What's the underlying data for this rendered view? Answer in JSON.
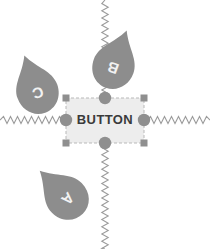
{
  "canvas": {
    "width": 210,
    "height": 249,
    "background": "#ffffff"
  },
  "button": {
    "label": "BUTTON",
    "fill": "#ededed",
    "text_color": "#3a3a3a",
    "selection_outline_color": "#b9b9b9",
    "box": {
      "x": 66,
      "y": 98,
      "width": 78,
      "height": 45
    }
  },
  "selection_handles": {
    "square_color": "#8f8f8f",
    "circle_color": "#8f8f8f",
    "corners": [
      {
        "name": "top-left",
        "x": 66,
        "y": 98
      },
      {
        "name": "top-right",
        "x": 144,
        "y": 98
      },
      {
        "name": "bottom-left",
        "x": 66,
        "y": 143
      },
      {
        "name": "bottom-right",
        "x": 144,
        "y": 143
      }
    ],
    "edges": [
      {
        "name": "top-center",
        "x": 105,
        "y": 98
      },
      {
        "name": "right-middle",
        "x": 144,
        "y": 120
      },
      {
        "name": "bottom-center",
        "x": 105,
        "y": 143
      },
      {
        "name": "left-middle",
        "x": 66,
        "y": 120
      }
    ]
  },
  "pins": [
    {
      "id": "pin-a",
      "label": "A",
      "cx": 68,
      "cy": 199,
      "rotation": 135,
      "fill": "#8d8d8d"
    },
    {
      "id": "pin-b",
      "label": "B",
      "cx": 113,
      "cy": 68,
      "rotation": 200,
      "fill": "#8d8d8d"
    },
    {
      "id": "pin-c",
      "label": "C",
      "cx": 38,
      "cy": 93,
      "rotation": 160,
      "fill": "#8d8d8d"
    }
  ],
  "springs": [
    {
      "id": "spring-left",
      "orientation": "horizontal",
      "x1": 0,
      "x2": 63,
      "y": 120,
      "color": "#9c9c9c"
    },
    {
      "id": "spring-right",
      "orientation": "horizontal",
      "x1": 147,
      "x2": 210,
      "y": 120,
      "color": "#9c9c9c"
    },
    {
      "id": "spring-vertical",
      "orientation": "vertical",
      "y1": 0,
      "y2": 249,
      "x": 105,
      "color": "#9c9c9c"
    }
  ]
}
